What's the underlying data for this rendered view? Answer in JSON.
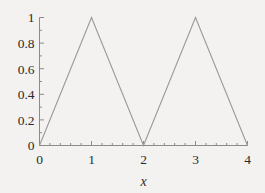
{
  "chart_data": {
    "type": "line",
    "title": "",
    "subtitle": "",
    "xlabel": "x",
    "ylabel": "",
    "xlim": [
      0,
      4
    ],
    "ylim": [
      0,
      1
    ],
    "grid": false,
    "legend": null,
    "x": [
      0,
      1,
      2,
      3,
      4
    ],
    "y": [
      0,
      1,
      0,
      1,
      0
    ],
    "series": [
      {
        "name": "triangle-wave",
        "color": "#9a9a9a",
        "points": [
          {
            "x": 0,
            "y": 0
          },
          {
            "x": 1,
            "y": 1
          },
          {
            "x": 2,
            "y": 0
          },
          {
            "x": 3,
            "y": 1
          },
          {
            "x": 4,
            "y": 0
          }
        ]
      }
    ],
    "x_ticks": [
      {
        "value": 0,
        "label": "0"
      },
      {
        "value": 1,
        "label": "1"
      },
      {
        "value": 2,
        "label": "2"
      },
      {
        "value": 3,
        "label": "3"
      },
      {
        "value": 4,
        "label": "4"
      }
    ],
    "x_minor_ticks": [
      0.2,
      0.4,
      0.6,
      0.8,
      1.2,
      1.4,
      1.6,
      1.8,
      2.2,
      2.4,
      2.6,
      2.8,
      3.2,
      3.4,
      3.6,
      3.8
    ],
    "y_ticks": [
      {
        "value": 0,
        "label": "0"
      },
      {
        "value": 0.2,
        "label": "0.2"
      },
      {
        "value": 0.4,
        "label": "0.4"
      },
      {
        "value": 0.6,
        "label": "0.6"
      },
      {
        "value": 0.8,
        "label": "0.8"
      },
      {
        "value": 1,
        "label": "1"
      }
    ],
    "y_minor_ticks": [
      0.1,
      0.3,
      0.5,
      0.7,
      0.9
    ],
    "colors": {
      "background": "#f3f2f0",
      "line": "#9a9a9a",
      "axis": "#8a8a8a",
      "text": "#2b2b2b"
    }
  }
}
